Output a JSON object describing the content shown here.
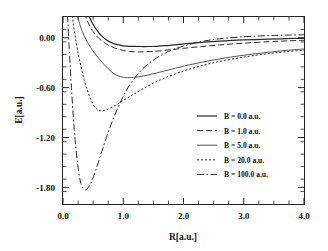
{
  "chart_data": {
    "type": "line",
    "title": "",
    "xlabel": "R[a.u.]",
    "ylabel": "E[a.u.]",
    "xlim": [
      0.0,
      4.0
    ],
    "ylim": [
      -2.0,
      0.25
    ],
    "grid": false,
    "legend_position": "center-right",
    "xticks": [
      "0.0",
      "1.0",
      "2.0",
      "3.0",
      "4.0"
    ],
    "xtick_values": [
      0.0,
      1.0,
      2.0,
      3.0,
      4.0
    ],
    "yticks": [
      "0.00",
      "-0.60",
      "-1.20",
      "-1.80"
    ],
    "ytick_values": [
      0.0,
      -0.6,
      -1.2,
      -1.8
    ],
    "series": [
      {
        "name": "B = 0.0 a.u.",
        "style": "solid",
        "minimum": {
          "x": 1.42,
          "y": -0.1
        },
        "x": [
          0.3,
          0.35,
          0.4,
          0.45,
          0.5,
          0.6,
          0.7,
          0.8,
          0.9,
          1.0,
          1.1,
          1.2,
          1.3,
          1.42,
          1.55,
          1.7,
          1.9,
          2.1,
          2.4,
          2.7,
          3.0,
          3.4,
          3.7,
          4.0
        ],
        "y": [
          0.6,
          0.44,
          0.32,
          0.23,
          0.16,
          0.055,
          -0.015,
          -0.058,
          -0.083,
          -0.096,
          -0.102,
          -0.104,
          -0.105,
          -0.105,
          -0.102,
          -0.095,
          -0.082,
          -0.068,
          -0.05,
          -0.036,
          -0.026,
          -0.016,
          -0.01,
          -0.006
        ]
      },
      {
        "name": "B = 1.0 a.u.",
        "style": "dashed",
        "minimum": {
          "x": 1.3,
          "y": -0.17
        },
        "x": [
          0.25,
          0.3,
          0.35,
          0.4,
          0.45,
          0.5,
          0.6,
          0.7,
          0.8,
          0.9,
          1.0,
          1.1,
          1.2,
          1.3,
          1.45,
          1.6,
          1.8,
          2.0,
          2.3,
          2.6,
          3.0,
          3.4,
          3.7,
          4.0
        ],
        "y": [
          0.62,
          0.44,
          0.31,
          0.21,
          0.135,
          0.075,
          -0.01,
          -0.065,
          -0.105,
          -0.133,
          -0.152,
          -0.163,
          -0.169,
          -0.17,
          -0.166,
          -0.157,
          -0.142,
          -0.127,
          -0.105,
          -0.086,
          -0.065,
          -0.048,
          -0.038,
          -0.03
        ]
      },
      {
        "name": "B = 5.0 a.u.",
        "style": "thin-solid",
        "minimum": {
          "x": 0.88,
          "y": -0.48
        },
        "x": [
          0.16,
          0.2,
          0.25,
          0.3,
          0.35,
          0.4,
          0.45,
          0.5,
          0.6,
          0.7,
          0.8,
          0.88,
          1.0,
          1.1,
          1.25,
          1.4,
          1.6,
          1.8,
          2.1,
          2.4,
          2.7,
          3.0,
          3.4,
          3.7,
          4.0
        ],
        "y": [
          0.62,
          0.42,
          0.24,
          0.115,
          0.025,
          -0.045,
          -0.105,
          -0.16,
          -0.255,
          -0.335,
          -0.405,
          -0.448,
          -0.475,
          -0.48,
          -0.47,
          -0.45,
          -0.415,
          -0.378,
          -0.325,
          -0.28,
          -0.242,
          -0.21,
          -0.175,
          -0.152,
          -0.135
        ]
      },
      {
        "name": "B = 20.0 a.u.",
        "style": "dotted",
        "minimum": {
          "x": 0.62,
          "y": -0.88
        },
        "x": [
          0.1,
          0.13,
          0.16,
          0.2,
          0.25,
          0.3,
          0.35,
          0.4,
          0.45,
          0.5,
          0.55,
          0.62,
          0.7,
          0.8,
          0.9,
          1.0,
          1.15,
          1.3,
          1.5,
          1.7,
          2.0,
          2.3,
          2.6,
          3.0,
          3.4,
          3.7,
          4.0
        ],
        "y": [
          0.6,
          0.4,
          0.22,
          0.03,
          -0.18,
          -0.35,
          -0.5,
          -0.625,
          -0.725,
          -0.8,
          -0.85,
          -0.88,
          -0.87,
          -0.84,
          -0.8,
          -0.755,
          -0.69,
          -0.625,
          -0.545,
          -0.48,
          -0.4,
          -0.335,
          -0.285,
          -0.232,
          -0.192,
          -0.168,
          -0.15
        ]
      },
      {
        "name": "B = 100.0 a.u.",
        "style": "dash-dot",
        "minimum": {
          "x": 0.37,
          "y": -1.83
        },
        "x": [
          0.05,
          0.07,
          0.09,
          0.11,
          0.14,
          0.17,
          0.2,
          0.24,
          0.28,
          0.32,
          0.37,
          0.42,
          0.48,
          0.55,
          0.63,
          0.72,
          0.82,
          0.95,
          1.1,
          1.3,
          1.5,
          1.75,
          2.0,
          2.3,
          2.6,
          3.0,
          3.4,
          3.7,
          4.0
        ],
        "y": [
          0.6,
          0.33,
          0.06,
          -0.22,
          -0.6,
          -0.94,
          -1.22,
          -1.5,
          -1.7,
          -1.8,
          -1.832,
          -1.8,
          -1.72,
          -1.58,
          -1.4,
          -1.2,
          -1.0,
          -0.78,
          -0.575,
          -0.39,
          -0.268,
          -0.165,
          -0.1,
          -0.045,
          -0.012,
          0.012,
          0.026,
          0.032,
          0.036
        ]
      }
    ]
  },
  "axes": {
    "x_label": "R[a.u.]",
    "y_label": "E[a.u.]"
  }
}
